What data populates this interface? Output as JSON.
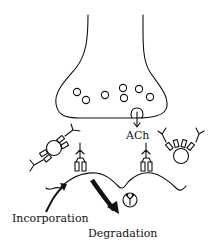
{
  "diagram": {
    "title": "",
    "labels": {
      "neurotransmitter": "ACh",
      "incorporation": "Incorporation",
      "degradation": "Degradation"
    },
    "components": [
      {
        "id": "nerve-terminal",
        "type": "presynaptic terminal with synaptic vesicles",
        "vesicle_count": 8
      },
      {
        "id": "release",
        "type": "exocytosing vesicle with arrow labeled ACh"
      },
      {
        "id": "internal-vesicle-left",
        "type": "vesicle carrying receptors (diagonal)"
      },
      {
        "id": "internal-vesicle-right",
        "type": "vesicle carrying receptors (clustered)"
      },
      {
        "id": "membrane",
        "type": "postsynaptic membrane with folds"
      },
      {
        "id": "receptor-left",
        "type": "membrane receptor with antibody-like Y"
      },
      {
        "id": "receptor-right",
        "type": "membrane receptor with antibody-like Y"
      },
      {
        "id": "incorporation-arrow",
        "type": "thin curved arrow into membrane"
      },
      {
        "id": "degradation-arrow",
        "type": "thick curved arrow out of membrane"
      },
      {
        "id": "degraded-complex",
        "type": "circle containing receptor/antibody fragments"
      }
    ],
    "colors": {
      "stroke": "#111111",
      "background": "#ffffff"
    }
  }
}
